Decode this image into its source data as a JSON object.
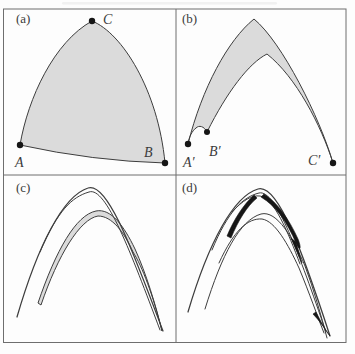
{
  "colors": {
    "background": "#fdfdfd",
    "frame": "#6e6e6e",
    "curve": "#3d3d3d",
    "shade": "#dbdbdb",
    "dark": "#161616",
    "text": "#3b3b3b"
  },
  "panels": {
    "a": {
      "label": "(a)",
      "label_pos": {
        "x": 16,
        "y": 23
      },
      "region_d": "M 20,145 C 28,98 54,42 92,21 C 122,33 158,90 165,163 Q 93,161 20,145 Z",
      "points": [
        {
          "name": "A",
          "x": 20,
          "y": 145,
          "label_x": 15,
          "label_y": 167
        },
        {
          "name": "B",
          "x": 165,
          "y": 163,
          "label_x": 144,
          "label_y": 157
        },
        {
          "name": "C",
          "x": 92,
          "y": 21,
          "label_x": 103,
          "label_y": 24
        }
      ]
    },
    "b": {
      "label": "(b)",
      "label_pos": {
        "x": 182,
        "y": 23
      },
      "region_d": "M 188,144 C 202,88 228,40 254,19 C 282,42 320,118 333,163 C 321,125 296,77 267,54 C 249,63 227,92 207,132 C 204,126 199,125 196,128 C 192,131 189,137 188,144 Z",
      "points": [
        {
          "name": "A′",
          "x": 188,
          "y": 144,
          "label_x": 183,
          "label_y": 167
        },
        {
          "name": "B′",
          "x": 207,
          "y": 132,
          "label_x": 209,
          "label_y": 156
        },
        {
          "name": "C′",
          "x": 333,
          "y": 163,
          "label_x": 308,
          "label_y": 165
        }
      ]
    },
    "c": {
      "label": "(c)",
      "label_pos": {
        "x": 16,
        "y": 192
      },
      "outer1_d": "M 17,317 C 38,245 63,196 88,188 C 108,181 134,255 163,331",
      "outer2_d": "M 40,252 C 58,210 72,197 89,192 C 106,186 131,253 160,330",
      "shade_d": "M 38,303 C 56,250 76,215 96,211 C 111,208 124,226 135,249 C 146,273 156,306 162,331 C 153,295 142,266 133,252 C 124,232 112,216 98,216 C 80,219 58,255 41,305 Z"
    },
    "d": {
      "label": "(d)",
      "label_pos": {
        "x": 182,
        "y": 192
      },
      "outer1_d": "M 188,312 C 209,241 234,196 258,189 C 278,183 303,253 330,336",
      "outer2_d": "M 212,250 C 228,211 243,197 259,193 C 276,189 299,254 326,332",
      "outer3_d": "M 232,212 C 243,200 252,195 260,196 C 274,198 288,232 300,264",
      "inner1_d": "M 205,309 C 222,254 240,220 261,214 C 277,210 293,238 305,266 C 314,290 321,315 327,338",
      "inner2_d": "M 219,263 C 234,230 248,218 262,219 C 275,221 288,244 299,268 C 309,292 318,318 324,333",
      "dark1_d": "M 264,194 C 277,202 289,219 298,239 C 302,249 300,252 296,243 C 287,222 276,206 261,197 Z",
      "dark2_d": "M 316,312 C 321,322 326,331 330,336 C 325,329 319,320 313,314 Z",
      "dark3_d": "M 291,238 L 302,263 L 296,242 Z",
      "dark4_d": "M 227,236 C 234,219 244,204 254,195 L 257,198 C 247,206 238,221 231,238 Z"
    }
  }
}
